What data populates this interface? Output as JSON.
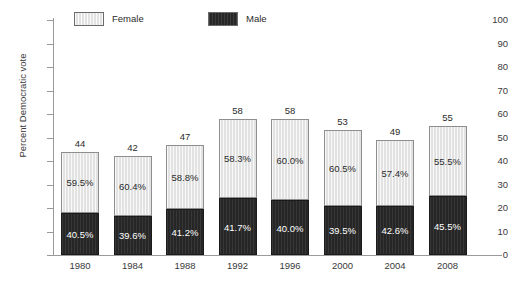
{
  "chart_data": {
    "type": "bar",
    "subtype": "stacked-bar",
    "title": "",
    "xlabel": "",
    "ylabel": "Percent Democratic vote",
    "ylim": [
      0,
      100
    ],
    "yticks": [
      0,
      10,
      20,
      30,
      40,
      50,
      60,
      70,
      80,
      90,
      100
    ],
    "grid": false,
    "legend_position": "top-left",
    "categories": [
      "1980",
      "1984",
      "1988",
      "1992",
      "1996",
      "2000",
      "2004",
      "2008"
    ],
    "totals": [
      44,
      42,
      47,
      58,
      58,
      53,
      49,
      55
    ],
    "total_labels": [
      "44",
      "42",
      "47",
      "58",
      "58",
      "53",
      "49",
      "55"
    ],
    "series": [
      {
        "name": "Female",
        "color": "#e2e2e2",
        "share_of_total_percent": [
          59.5,
          60.4,
          58.8,
          58.3,
          60.0,
          60.5,
          57.4,
          55.5
        ],
        "labels": [
          "59.5%",
          "60.4%",
          "58.8%",
          "58.3%",
          "60.0%",
          "60.5%",
          "57.4%",
          "55.5%"
        ],
        "values": [
          26.18,
          25.37,
          27.64,
          33.81,
          34.8,
          32.07,
          28.13,
          30.53
        ]
      },
      {
        "name": "Male",
        "color": "#262626",
        "share_of_total_percent": [
          40.5,
          39.6,
          41.2,
          41.7,
          40.0,
          39.5,
          42.6,
          45.5
        ],
        "labels": [
          "40.5%",
          "39.6%",
          "41.2%",
          "41.7%",
          "40.0%",
          "39.5%",
          "42.6%",
          "45.5%"
        ],
        "values": [
          17.82,
          16.63,
          19.36,
          24.19,
          23.2,
          20.94,
          20.87,
          25.03
        ]
      }
    ]
  },
  "legend": {
    "items": [
      {
        "label": "Female",
        "swatch": "female-swatch"
      },
      {
        "label": "Male",
        "swatch": "male-swatch"
      }
    ]
  },
  "colors": {
    "female": "#e2e2e2",
    "male": "#262626",
    "axis": "#9a9a9a",
    "text": "#2b2b2b",
    "background": "#ffffff"
  }
}
